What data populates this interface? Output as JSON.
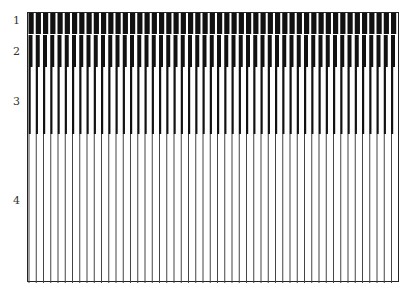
{
  "diagram": {
    "type": "grating-stimuli",
    "rows": [
      {
        "label": "1",
        "top": 0,
        "height": 21,
        "period": 7.25,
        "bar_width": 5.2,
        "color": "#111111"
      },
      {
        "label": "2",
        "top": 22,
        "height": 32,
        "period": 7.25,
        "bar_width": 4.0,
        "color": "#111111"
      },
      {
        "label": "3",
        "top": 54,
        "height": 67,
        "period": 7.25,
        "bar_width": 2.2,
        "color": "#111111"
      },
      {
        "label": "4",
        "top": 121,
        "height": 149,
        "period": 7.25,
        "bar_width": 1.0,
        "color": "#444444"
      }
    ],
    "labels": {
      "r1": "1",
      "r2": "2",
      "r3": "3",
      "r4": "4"
    }
  }
}
